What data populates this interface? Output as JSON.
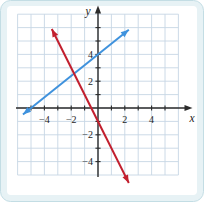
{
  "figure": {
    "kind": "coordinate-plane-graph"
  },
  "colors": {
    "card_background": "#e7f2f5",
    "card_border": "#c3dde4",
    "plot_background": "#ffffff",
    "grid": "#c6d6e4",
    "axis": "#2b2b2b",
    "label": "#1d1d1d",
    "blue_line": "#3f92dd",
    "red_line": "#c2202f"
  },
  "chart_data": {
    "type": "line",
    "title": "",
    "xlabel": "x",
    "ylabel": "y",
    "xlim": [
      -6,
      6
    ],
    "ylim": [
      -5,
      7
    ],
    "grid": true,
    "legend": "none",
    "x_tick_labels": [
      {
        "value": -4,
        "label": "−4"
      },
      {
        "value": -2,
        "label": "−2"
      },
      {
        "value": 2,
        "label": "2"
      },
      {
        "value": 4,
        "label": "4"
      }
    ],
    "y_tick_labels": [
      {
        "value": 4,
        "label": "4"
      },
      {
        "value": 2,
        "label": "2"
      },
      {
        "value": -2,
        "label": "−2"
      },
      {
        "value": -4,
        "label": "−4"
      }
    ],
    "x_minor_ticks": [
      -5,
      -4,
      -3,
      -2,
      -1,
      1,
      2,
      3,
      4,
      5
    ],
    "y_minor_ticks": [
      -4,
      -3,
      -2,
      -1,
      1,
      2,
      3,
      4,
      5,
      6
    ],
    "series": [
      {
        "name": "blue-line",
        "color": "#3f92dd",
        "equation": "y = (4/5)x + 4",
        "slope": 0.8,
        "y_intercept": 4,
        "x_intercept": -5,
        "points": [
          [
            -5,
            0
          ],
          [
            0,
            4
          ]
        ],
        "x_range": [
          -5.6,
          2.3
        ],
        "arrows": "both"
      },
      {
        "name": "red-line",
        "color": "#c2202f",
        "equation": "y = −2x − 1",
        "slope": -2,
        "y_intercept": -1,
        "x_intercept": -0.5,
        "points": [
          [
            -0.5,
            0
          ],
          [
            0,
            -1
          ]
        ],
        "x_range": [
          -3.45,
          2.3
        ],
        "arrows": "both"
      }
    ]
  }
}
